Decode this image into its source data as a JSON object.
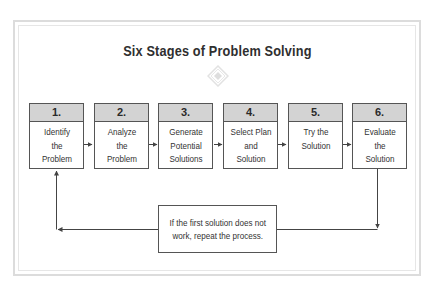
{
  "diagram": {
    "title": "Six Stages of Problem Solving",
    "ornament_icon": "diamond-ornament-icon",
    "stages": [
      {
        "number": "1.",
        "label": "Identify\nthe\nProblem"
      },
      {
        "number": "2.",
        "label": "Analyze\nthe\nProblem"
      },
      {
        "number": "3.",
        "label": "Generate\nPotential\nSolutions"
      },
      {
        "number": "4.",
        "label": "Select Plan\nand\nSolution"
      },
      {
        "number": "5.",
        "label": "Try the\nSolution"
      },
      {
        "number": "6.",
        "label": "Evaluate\nthe\nSolution"
      }
    ],
    "loop_note_line1": "If the first solution does not",
    "loop_note_line2": "work, repeat the process.",
    "colors": {
      "header_fill": "#d3d3d3",
      "border": "#555555",
      "frame": "#dcdcdc",
      "title": "#2f2f2f"
    }
  }
}
